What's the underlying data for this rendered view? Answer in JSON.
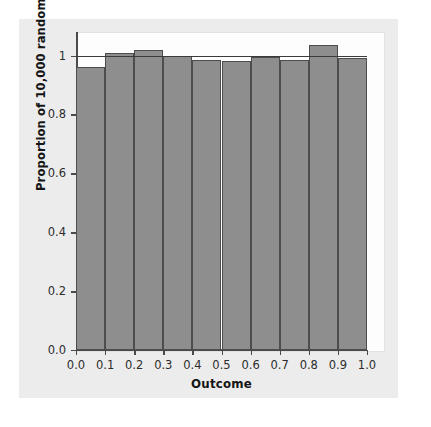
{
  "chart_data": {
    "type": "bar",
    "title": "",
    "subtitle": "",
    "xlabel": "Outcome",
    "ylabel": "Proportion of 10,000 random numbers",
    "xlim": [
      0.0,
      1.0
    ],
    "ylim": [
      0.0,
      1.08
    ],
    "grid": false,
    "legend": null,
    "bin_edges": [
      0.0,
      0.1,
      0.2,
      0.3,
      0.4,
      0.5,
      0.6,
      0.7,
      0.8,
      0.9,
      1.0
    ],
    "categories": [
      "0.0-0.1",
      "0.1-0.2",
      "0.2-0.3",
      "0.3-0.4",
      "0.4-0.5",
      "0.5-0.6",
      "0.6-0.7",
      "0.7-0.8",
      "0.8-0.9",
      "0.9-1.0"
    ],
    "values": [
      0.962,
      1.009,
      1.018,
      0.999,
      0.986,
      0.983,
      0.996,
      0.986,
      1.037,
      0.991
    ],
    "reference_line": {
      "value": 1.0,
      "label": "expected proportion",
      "orientation": "horizontal"
    },
    "xticks": [
      "0.0",
      "0.1",
      "0.2",
      "0.3",
      "0.4",
      "0.5",
      "0.6",
      "0.7",
      "0.8",
      "0.9",
      "1.0"
    ],
    "xtick_values": [
      0.0,
      0.1,
      0.2,
      0.3,
      0.4,
      0.5,
      0.6,
      0.7,
      0.8,
      0.9,
      1.0
    ],
    "yticks": [
      "0.0",
      "0.2",
      "0.4",
      "0.6",
      "0.8",
      "1"
    ],
    "ytick_values": [
      0.0,
      0.2,
      0.4,
      0.6,
      0.8,
      1.0
    ],
    "colors": {
      "bar_fill": "#8e8e8e",
      "bar_edge": "#4d4d4d",
      "axis": "#4a4a4a",
      "reference_line": "#3a3a3a",
      "panel_background": "#fdfdfd",
      "card_background": "#ececec",
      "figure_background": "#ffffff",
      "text": "#151515"
    }
  }
}
